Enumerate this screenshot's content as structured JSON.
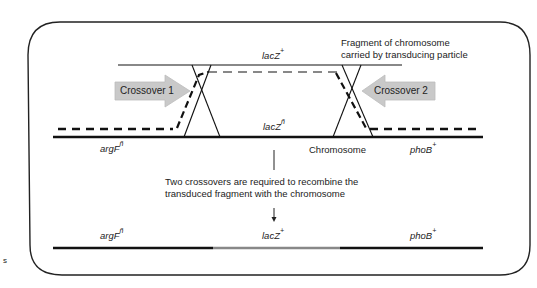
{
  "diagram": {
    "fragment_caption_line1": "Fragment of chromosome",
    "fragment_caption_line2": "carried by transducing particle",
    "crossover1_label": "Crossover 1",
    "crossover2_label": "Crossover 2",
    "chromosome_label": "Chromosome",
    "top_genes": {
      "lacZ_plus": {
        "name": "lacZ",
        "sup": "+"
      },
      "lacZ_minus": {
        "name": "lacZ",
        "sup": "ñ"
      },
      "argF_minus": {
        "name": "argF",
        "sup": "ñ"
      },
      "phoB_plus": {
        "name": "phoB",
        "sup": "+"
      }
    },
    "explanation_line1": "Two crossovers are required to recombine the",
    "explanation_line2": "transduced fragment with the chromosome",
    "result_genes": {
      "argF": {
        "name": "argF",
        "sup": "ñ"
      },
      "lacZ": {
        "name": "lacZ",
        "sup": "+"
      },
      "phoB": {
        "name": "phoB",
        "sup": "+"
      }
    },
    "margin_fragment": "s",
    "colors": {
      "chromosome": "#111111",
      "fragment": "#888888",
      "arrow_fill": "#c8c8c8",
      "border": "#222222"
    }
  }
}
